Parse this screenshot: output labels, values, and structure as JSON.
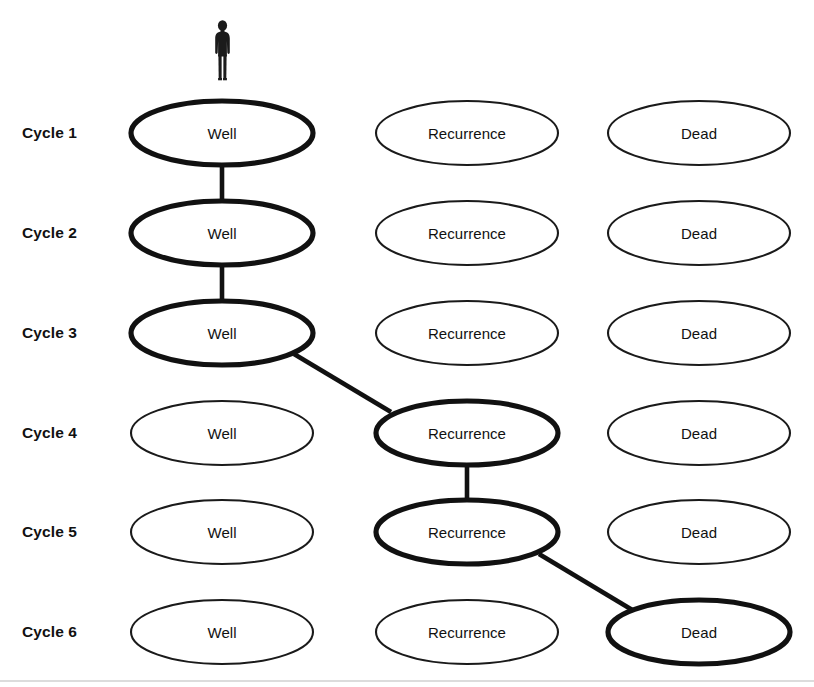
{
  "diagram": {
    "background_color": "#ffffff",
    "line_color": "#111111",
    "highlight_note": "Bold outlines and connecting lines trace one patient's path through the states.",
    "actor": {
      "icon": "person-icon",
      "label": "Patient",
      "x": 222,
      "y": 50
    },
    "geometry": {
      "ellipse_rx": 91,
      "ellipse_ry": 32,
      "column_centers_x": [
        222,
        467,
        699
      ],
      "row_centers_y": [
        133,
        233,
        333,
        433,
        532,
        632
      ]
    },
    "columns": [
      {
        "id": "well",
        "label": "Well",
        "cx": 222
      },
      {
        "id": "recurrence",
        "label": "Recurrence",
        "cx": 467
      },
      {
        "id": "dead",
        "label": "Dead",
        "cx": 699
      }
    ],
    "rows": [
      {
        "id": "cycle-1",
        "label": "Cycle 1",
        "cy": 133
      },
      {
        "id": "cycle-2",
        "label": "Cycle 2",
        "cy": 233
      },
      {
        "id": "cycle-3",
        "label": "Cycle 3",
        "cy": 333
      },
      {
        "id": "cycle-4",
        "label": "Cycle 4",
        "cy": 433
      },
      {
        "id": "cycle-5",
        "label": "Cycle 5",
        "cy": 532
      },
      {
        "id": "cycle-6",
        "label": "Cycle 6",
        "cy": 632
      }
    ],
    "nodes": [
      {
        "id": "n-1-well",
        "row": "cycle-1",
        "column": "well",
        "label": "Well",
        "cx": 222,
        "cy": 133,
        "highlighted": true
      },
      {
        "id": "n-1-recurrence",
        "row": "cycle-1",
        "column": "recurrence",
        "label": "Recurrence",
        "cx": 467,
        "cy": 133,
        "highlighted": false
      },
      {
        "id": "n-1-dead",
        "row": "cycle-1",
        "column": "dead",
        "label": "Dead",
        "cx": 699,
        "cy": 133,
        "highlighted": false
      },
      {
        "id": "n-2-well",
        "row": "cycle-2",
        "column": "well",
        "label": "Well",
        "cx": 222,
        "cy": 233,
        "highlighted": true
      },
      {
        "id": "n-2-recurrence",
        "row": "cycle-2",
        "column": "recurrence",
        "label": "Recurrence",
        "cx": 467,
        "cy": 233,
        "highlighted": false
      },
      {
        "id": "n-2-dead",
        "row": "cycle-2",
        "column": "dead",
        "label": "Dead",
        "cx": 699,
        "cy": 233,
        "highlighted": false
      },
      {
        "id": "n-3-well",
        "row": "cycle-3",
        "column": "well",
        "label": "Well",
        "cx": 222,
        "cy": 333,
        "highlighted": true
      },
      {
        "id": "n-3-recurrence",
        "row": "cycle-3",
        "column": "recurrence",
        "label": "Recurrence",
        "cx": 467,
        "cy": 333,
        "highlighted": false
      },
      {
        "id": "n-3-dead",
        "row": "cycle-3",
        "column": "dead",
        "label": "Dead",
        "cx": 699,
        "cy": 333,
        "highlighted": false
      },
      {
        "id": "n-4-well",
        "row": "cycle-4",
        "column": "well",
        "label": "Well",
        "cx": 222,
        "cy": 433,
        "highlighted": false
      },
      {
        "id": "n-4-recurrence",
        "row": "cycle-4",
        "column": "recurrence",
        "label": "Recurrence",
        "cx": 467,
        "cy": 433,
        "highlighted": true
      },
      {
        "id": "n-4-dead",
        "row": "cycle-4",
        "column": "dead",
        "label": "Dead",
        "cx": 699,
        "cy": 433,
        "highlighted": false
      },
      {
        "id": "n-5-well",
        "row": "cycle-5",
        "column": "well",
        "label": "Well",
        "cx": 222,
        "cy": 532,
        "highlighted": false
      },
      {
        "id": "n-5-recurrence",
        "row": "cycle-5",
        "column": "recurrence",
        "label": "Recurrence",
        "cx": 467,
        "cy": 532,
        "highlighted": true
      },
      {
        "id": "n-5-dead",
        "row": "cycle-5",
        "column": "dead",
        "label": "Dead",
        "cx": 699,
        "cy": 532,
        "highlighted": false
      },
      {
        "id": "n-6-well",
        "row": "cycle-6",
        "column": "well",
        "label": "Well",
        "cx": 222,
        "cy": 632,
        "highlighted": false
      },
      {
        "id": "n-6-recurrence",
        "row": "cycle-6",
        "column": "recurrence",
        "label": "Recurrence",
        "cx": 467,
        "cy": 632,
        "highlighted": false
      },
      {
        "id": "n-6-dead",
        "row": "cycle-6",
        "column": "dead",
        "label": "Dead",
        "cx": 699,
        "cy": 632,
        "highlighted": true
      }
    ],
    "transitions": [
      {
        "id": "t-well1-well2",
        "from": "n-1-well",
        "to": "n-2-well",
        "kind": "vertical",
        "x1": 222,
        "y1": 164,
        "x2": 222,
        "y2": 202
      },
      {
        "id": "t-well2-well3",
        "from": "n-2-well",
        "to": "n-3-well",
        "kind": "vertical",
        "x1": 222,
        "y1": 264,
        "x2": 222,
        "y2": 302
      },
      {
        "id": "t-well3-recur4",
        "from": "n-3-well",
        "to": "n-4-recurrence",
        "kind": "diagonal",
        "x1": 294,
        "y1": 354,
        "x2": 391,
        "y2": 412
      },
      {
        "id": "t-recur4-recur5",
        "from": "n-4-recurrence",
        "to": "n-5-recurrence",
        "kind": "vertical",
        "x1": 467,
        "y1": 464,
        "x2": 467,
        "y2": 501
      },
      {
        "id": "t-recur5-dead6",
        "from": "n-5-recurrence",
        "to": "n-6-dead",
        "kind": "diagonal",
        "x1": 539,
        "y1": 554,
        "x2": 634,
        "y2": 611
      }
    ],
    "path_sequence": [
      "Well",
      "Well",
      "Well",
      "Recurrence",
      "Recurrence",
      "Dead"
    ]
  }
}
